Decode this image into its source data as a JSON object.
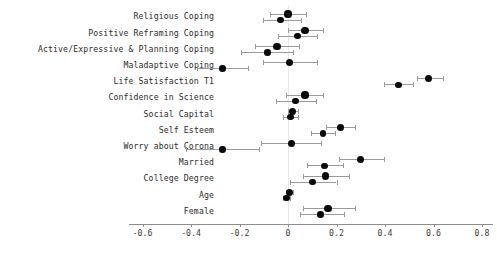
{
  "chart_data": {
    "type": "scatter",
    "title": "",
    "xlabel": "",
    "ylabel": "",
    "xlim": [
      -0.7,
      0.85
    ],
    "grid": false,
    "legend": null,
    "zero_reference_line": 0,
    "xticks": [
      -0.6,
      -0.4,
      -0.2,
      0,
      0.2,
      0.4,
      0.6,
      0.8
    ],
    "xticklabels": [
      "-0.6",
      "-0.4",
      "-0.2",
      "0",
      "0.2",
      "0.4",
      "0.6",
      "0.8"
    ],
    "categories": [
      "Religious Coping",
      "Positive Reframing Coping",
      "Active/Expressive & Planning Coping",
      "Maladaptive Coping",
      "Life Satisfaction T1",
      "Confidence in Science",
      "Social Capital",
      "Self Esteem",
      "Worry about Corona",
      "Married",
      "College Degree",
      "Age",
      "Female"
    ],
    "series": [
      {
        "name": "Estimate A",
        "estimates": [
          -0.03,
          0.04,
          -0.085,
          -0.27,
          0.455,
          0.03,
          0.01,
          0.145,
          -0.27,
          0.15,
          0.1,
          -0.005,
          0.135
        ],
        "ci_low": [
          -0.105,
          -0.04,
          -0.195,
          -0.375,
          0.395,
          -0.05,
          -0.02,
          0.095,
          -0.42,
          0.08,
          0.01,
          -0.02,
          0.05
        ],
        "ci_high": [
          0.055,
          0.12,
          0.02,
          -0.165,
          0.515,
          0.115,
          0.04,
          0.195,
          -0.12,
          0.225,
          0.2,
          0.01,
          0.23
        ]
      },
      {
        "name": "Estimate B",
        "estimates": [
          0.0,
          0.07,
          -0.045,
          0.005,
          0.58,
          0.07,
          0.02,
          0.215,
          0.015,
          0.3,
          0.155,
          0.005,
          0.165
        ],
        "ci_low": [
          -0.075,
          0.0,
          -0.135,
          -0.105,
          0.53,
          -0.01,
          0.0,
          0.155,
          -0.11,
          0.21,
          0.06,
          -0.01,
          0.06
        ],
        "ci_high": [
          0.075,
          0.145,
          0.045,
          0.12,
          0.64,
          0.145,
          0.04,
          0.275,
          0.135,
          0.395,
          0.25,
          0.02,
          0.275
        ]
      }
    ]
  },
  "axis": {
    "tick_labels": [
      "-0.6",
      "-0.4",
      "-0.2",
      "0",
      "0.2",
      "0.4",
      "0.6",
      "0.8"
    ]
  },
  "labels": [
    "Religious Coping",
    "Positive Reframing Coping",
    "Active/Expressive & Planning Coping",
    "Maladaptive Coping",
    "Life Satisfaction T1",
    "Confidence in Science",
    "Social Capital",
    "Self Esteem",
    "Worry about Corona",
    "Married",
    "College Degree",
    "Age",
    "Female"
  ],
  "colors": {
    "point": "#0a0a0a",
    "interval": "#9a9a9a",
    "axis": "#8d8d8d",
    "zero_line": "#e8e8e8",
    "text": "#2b2b2b"
  }
}
